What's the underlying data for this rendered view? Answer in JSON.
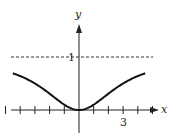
{
  "chart_data": {
    "type": "line",
    "title": "",
    "xlabel": "x",
    "ylabel": "y",
    "series": [
      {
        "name": "y = x^2/(x^2+9)",
        "function": "x^2/(x^2+9)",
        "x_range": [
          -4.5,
          4.5
        ]
      }
    ],
    "asymptote": {
      "y": 1,
      "style": "dashed",
      "label": "1"
    },
    "x_ticks": [
      -5,
      -4,
      -3,
      -2,
      -1,
      1,
      2,
      3,
      4,
      5
    ],
    "x_tick_labels": [
      {
        "value": 3,
        "label": "3"
      }
    ],
    "y_tick_labels": [
      {
        "value": 1,
        "label": "1"
      }
    ],
    "xlim": [
      -5.4,
      5.5
    ],
    "ylim": [
      -0.55,
      1.6
    ],
    "grid": false,
    "legend": "none"
  },
  "labels": {
    "x_axis": "x",
    "y_axis": "y",
    "y_one": "1",
    "x_three": "3"
  },
  "colors": {
    "curve": "#111111",
    "axes": "#222222",
    "dashed": "#333333"
  }
}
